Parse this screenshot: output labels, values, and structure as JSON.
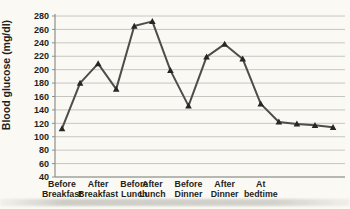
{
  "window": {
    "width": 350,
    "height": 209
  },
  "chart_data": {
    "type": "line",
    "title": "",
    "xlabel": "",
    "ylabel": "Blood glucose (mg/dl)",
    "ylim": [
      40,
      280
    ],
    "ytick_interval": 20,
    "ytick_labels": [
      "40",
      "60",
      "80",
      "100",
      "120",
      "140",
      "160",
      "180",
      "200",
      "220",
      "240",
      "260",
      "280"
    ],
    "grid": true,
    "legend_position": "none",
    "marker": "triangle",
    "series": [
      {
        "name": "Blood glucose readings",
        "values": [
          112,
          180,
          209,
          171,
          265,
          272,
          199,
          146,
          219,
          238,
          216,
          149,
          122,
          119,
          117,
          114
        ]
      }
    ],
    "x_tick_labels": [
      {
        "text": "Before Breakfast",
        "lines": [
          "Before",
          "Breakfast"
        ],
        "at_point": 0
      },
      {
        "text": "After Breakfast",
        "lines": [
          "After",
          "Breakfast"
        ],
        "at_point": 2
      },
      {
        "text": "Before Lunch",
        "lines": [
          "Before",
          "Lunch"
        ],
        "at_point": 4
      },
      {
        "text": "After Lunch",
        "lines": [
          "After",
          "Lunch"
        ],
        "at_point": 5
      },
      {
        "text": "Before Dinner",
        "lines": [
          "Before",
          "Dinner"
        ],
        "at_point": 7
      },
      {
        "text": "After Dinner",
        "lines": [
          "After",
          "Dinner"
        ],
        "at_point": 9
      },
      {
        "text": "At bedtime",
        "lines": [
          "At",
          "bedtime"
        ],
        "at_point": 11
      }
    ],
    "colors": {
      "line": "#4d4d4a",
      "marker": "#262624",
      "gridline": "#c6c6c0",
      "axis": "#8f8f8a",
      "text": "#1f1f1d",
      "background": "#fbf9f4"
    }
  }
}
